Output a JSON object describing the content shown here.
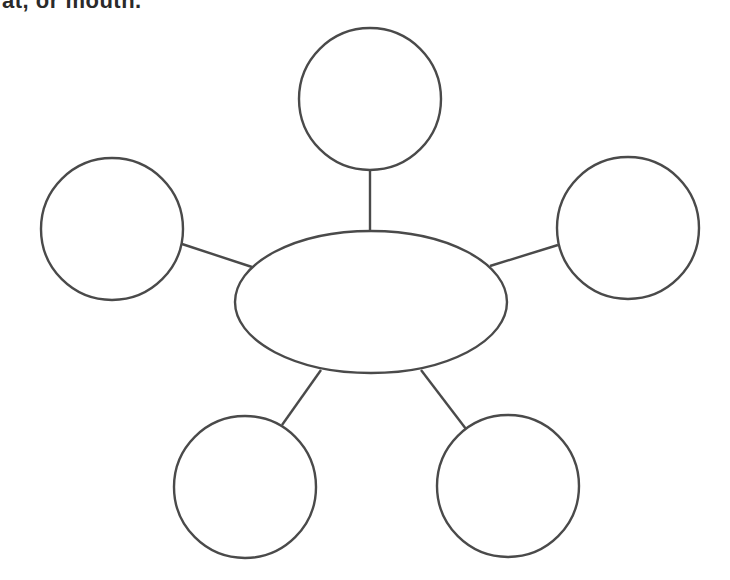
{
  "header": {
    "clipped_text": "at, or mouth."
  },
  "diagram": {
    "type": "concept-web",
    "stroke_color": "#4a4a4a",
    "background": "#ffffff",
    "center": {
      "shape": "ellipse",
      "cx": 371,
      "cy": 302,
      "rx": 136,
      "ry": 71,
      "label": ""
    },
    "nodes": [
      {
        "id": "top",
        "shape": "circle",
        "cx": 370,
        "cy": 99,
        "r": 71,
        "label": ""
      },
      {
        "id": "left",
        "shape": "circle",
        "cx": 112,
        "cy": 229,
        "r": 71,
        "label": ""
      },
      {
        "id": "right",
        "shape": "circle",
        "cx": 628,
        "cy": 228,
        "r": 71,
        "label": ""
      },
      {
        "id": "bottom-left",
        "shape": "circle",
        "cx": 245,
        "cy": 487,
        "r": 71,
        "label": ""
      },
      {
        "id": "bottom-right",
        "shape": "circle",
        "cx": 508,
        "cy": 486,
        "r": 71,
        "label": ""
      }
    ],
    "links": [
      {
        "from": "center",
        "to": "top",
        "x1": 370,
        "y1": 231,
        "x2": 370,
        "y2": 170
      },
      {
        "from": "center",
        "to": "left",
        "x1": 252,
        "y1": 267,
        "x2": 182,
        "y2": 244
      },
      {
        "from": "center",
        "to": "right",
        "x1": 490,
        "y1": 266,
        "x2": 558,
        "y2": 245
      },
      {
        "from": "center",
        "to": "bottom-left",
        "x1": 321,
        "y1": 370,
        "x2": 282,
        "y2": 425
      },
      {
        "from": "center",
        "to": "bottom-right",
        "x1": 421,
        "y1": 370,
        "x2": 466,
        "y2": 429
      }
    ]
  }
}
